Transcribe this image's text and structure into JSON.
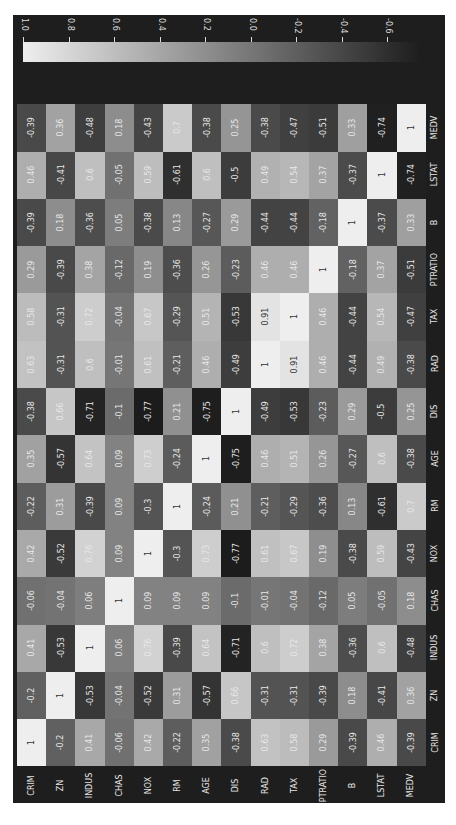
{
  "chart_data": {
    "type": "heatmap",
    "title": "",
    "orientation_note": "figure rotated 90 degrees; row labels along bottom, column labels along right edge",
    "labels": [
      "CRIM",
      "ZN",
      "INDUS",
      "CHAS",
      "NOX",
      "RM",
      "AGE",
      "DIS",
      "RAD",
      "TAX",
      "PTRATIO",
      "B",
      "LSTAT",
      "MEDV"
    ],
    "matrix": [
      [
        1,
        -0.2,
        0.41,
        -0.06,
        0.42,
        -0.22,
        0.35,
        -0.38,
        0.63,
        0.58,
        0.29,
        -0.39,
        0.46,
        -0.39
      ],
      [
        -0.2,
        1,
        -0.53,
        -0.04,
        -0.52,
        0.31,
        -0.57,
        0.66,
        -0.31,
        -0.31,
        -0.39,
        0.18,
        -0.41,
        0.36
      ],
      [
        0.41,
        -0.53,
        1,
        0.06,
        0.76,
        -0.39,
        0.64,
        -0.71,
        0.6,
        0.72,
        0.38,
        -0.36,
        0.6,
        -0.48
      ],
      [
        -0.06,
        -0.04,
        0.06,
        1,
        0.09,
        0.09,
        0.09,
        -0.1,
        -0.01,
        -0.04,
        -0.12,
        0.05,
        -0.05,
        0.18
      ],
      [
        0.42,
        -0.52,
        0.76,
        0.09,
        1,
        -0.3,
        0.73,
        -0.77,
        0.61,
        0.67,
        0.19,
        -0.38,
        0.59,
        -0.43
      ],
      [
        -0.22,
        0.31,
        -0.39,
        0.09,
        -0.3,
        1,
        -0.24,
        0.21,
        -0.21,
        -0.29,
        -0.36,
        0.13,
        -0.61,
        0.7
      ],
      [
        0.35,
        -0.57,
        0.64,
        0.09,
        0.73,
        -0.24,
        1,
        -0.75,
        0.46,
        0.51,
        0.26,
        -0.27,
        0.6,
        -0.38
      ],
      [
        -0.38,
        0.66,
        -0.71,
        -0.1,
        -0.77,
        0.21,
        -0.75,
        1,
        -0.49,
        -0.53,
        -0.23,
        0.29,
        -0.5,
        0.25
      ],
      [
        0.63,
        -0.31,
        0.6,
        -0.01,
        0.61,
        -0.21,
        0.46,
        -0.49,
        1,
        0.91,
        0.46,
        -0.44,
        0.49,
        -0.38
      ],
      [
        0.58,
        -0.31,
        0.72,
        -0.04,
        0.67,
        -0.29,
        0.51,
        -0.53,
        0.91,
        1,
        0.46,
        -0.44,
        0.54,
        -0.47
      ],
      [
        0.29,
        -0.39,
        0.38,
        -0.12,
        0.19,
        -0.36,
        0.26,
        -0.23,
        0.46,
        0.46,
        1,
        -0.18,
        0.37,
        -0.51
      ],
      [
        -0.39,
        0.18,
        -0.36,
        0.05,
        -0.38,
        0.13,
        -0.27,
        0.29,
        -0.44,
        -0.44,
        -0.18,
        1,
        -0.37,
        0.33
      ],
      [
        0.46,
        -0.41,
        0.6,
        -0.05,
        0.59,
        -0.61,
        0.6,
        -0.5,
        0.49,
        0.54,
        0.37,
        -0.37,
        1,
        -0.74
      ],
      [
        -0.39,
        0.36,
        -0.48,
        0.18,
        -0.43,
        0.7,
        -0.38,
        0.25,
        -0.38,
        -0.47,
        -0.51,
        0.33,
        -0.74,
        1
      ]
    ],
    "colorbar": {
      "ticks": [
        "1.0",
        "0.8",
        "0.6",
        "0.4",
        "0.2",
        "0.0",
        "-0.2",
        "-0.4",
        "-0.6"
      ],
      "tick_values": [
        1.0,
        0.8,
        0.6,
        0.4,
        0.2,
        0.0,
        -0.2,
        -0.4,
        -0.6
      ],
      "range": [
        -0.77,
        1.0
      ],
      "colormap": "grayscale",
      "position": "top"
    },
    "colors": {
      "high": "#eeeeee",
      "low": "#1c1c1c",
      "background": "#1e1e1e",
      "text": "#e6e6e6"
    }
  }
}
